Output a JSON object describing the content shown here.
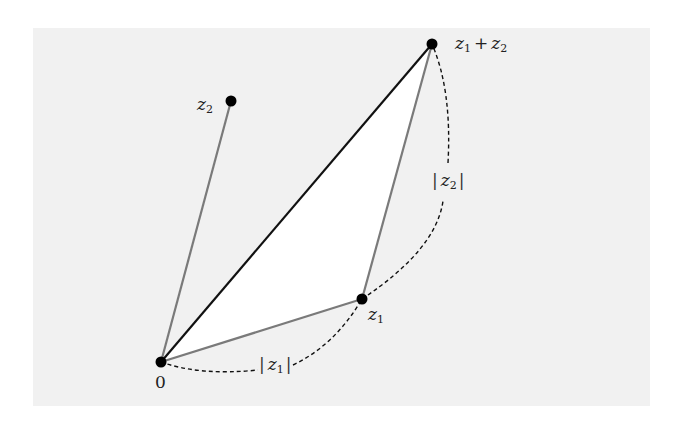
{
  "diagram": {
    "points": {
      "origin": {
        "label": "0",
        "x": 161,
        "y": 362
      },
      "z1": {
        "label": "z",
        "sub": "1",
        "x": 362,
        "y": 299
      },
      "z2": {
        "label": "z",
        "sub": "2",
        "x": 231,
        "y": 101
      },
      "sum": {
        "label": "z",
        "sub": "1",
        "plus": "+",
        "label2": "z",
        "sub2": "2",
        "x": 432,
        "y": 44
      }
    },
    "edges": [
      {
        "from": "origin",
        "to": "z2",
        "color": "#7a7a7a",
        "style": "solid"
      },
      {
        "from": "origin",
        "to": "z1",
        "color": "#7a7a7a",
        "style": "solid"
      },
      {
        "from": "z1",
        "to": "sum",
        "color": "#7a7a7a",
        "style": "solid"
      },
      {
        "from": "origin",
        "to": "sum",
        "color": "#111111",
        "style": "solid"
      }
    ],
    "arcs": [
      {
        "label": "|z1|",
        "from": "origin",
        "to": "z1",
        "style": "dashed"
      },
      {
        "label": "|z2|",
        "from": "z1",
        "to": "sum",
        "style": "dashed"
      }
    ],
    "modulus_labels": {
      "z1": {
        "bar_left": "|",
        "var": "z",
        "sub": "1",
        "bar_right": "|"
      },
      "z2": {
        "bar_left": "|",
        "var": "z",
        "sub": "2",
        "bar_right": "|"
      }
    },
    "colors": {
      "background_panel": "#f1f1f1",
      "triangle_fill": "#ffffff",
      "side_lines": "#7a7a7a",
      "sum_line": "#111111",
      "points": "#000000"
    }
  }
}
